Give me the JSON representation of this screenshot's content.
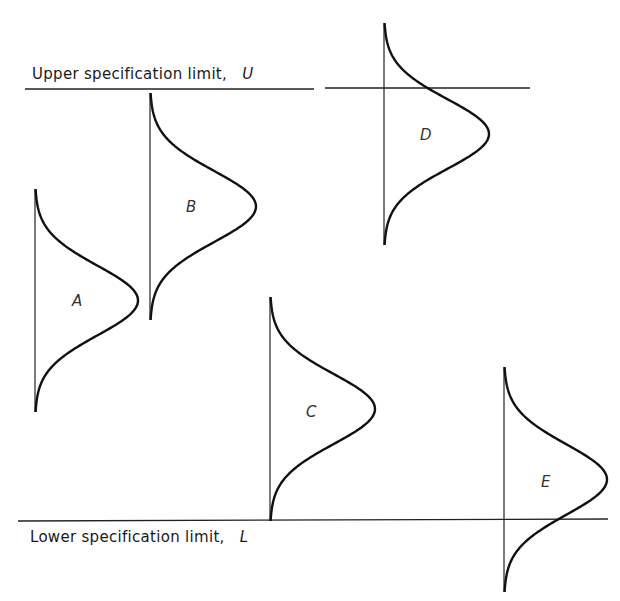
{
  "diagram": {
    "upper_limit": {
      "label": "Upper specification limit,",
      "symbol": "U",
      "y": 89
    },
    "lower_limit": {
      "label": "Lower specification limit,",
      "symbol": "L",
      "y": 520
    },
    "curves": [
      {
        "id": "A",
        "label": "A",
        "baseline_x": 35,
        "top": 189,
        "bottom": 412,
        "peak_x": 138
      },
      {
        "id": "B",
        "label": "B",
        "baseline_x": 150,
        "top": 93,
        "bottom": 320,
        "peak_x": 256
      },
      {
        "id": "C",
        "label": "C",
        "baseline_x": 270,
        "top": 297,
        "bottom": 521,
        "peak_x": 375
      },
      {
        "id": "D",
        "label": "D",
        "baseline_x": 384,
        "top": 23,
        "bottom": 245,
        "peak_x": 489
      },
      {
        "id": "E",
        "label": "E",
        "baseline_x": 504,
        "top": 367,
        "bottom": 592,
        "peak_x": 607
      }
    ],
    "colors": {
      "line": "#111111",
      "background": "#ffffff"
    }
  }
}
